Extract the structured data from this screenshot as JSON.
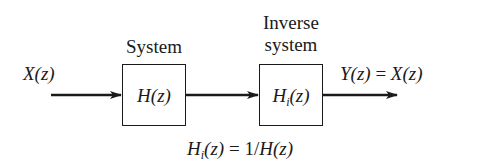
{
  "diagram": {
    "type": "block-diagram",
    "input": {
      "label_main": "X",
      "label_arg": "(z)"
    },
    "blocks": [
      {
        "title": "System",
        "fn_main": "H",
        "fn_sub": "",
        "fn_arg": "(z)"
      },
      {
        "title_line1": "Inverse",
        "title_line2": "system",
        "fn_main": "H",
        "fn_sub": "i",
        "fn_arg": "(z)"
      }
    ],
    "output": {
      "label_main": "Y",
      "label_arg": "(z)",
      "equals": " = ",
      "rhs_main": "X",
      "rhs_arg": "(z)"
    },
    "relation": {
      "lhs_main": "H",
      "lhs_sub": "i",
      "lhs_arg": "(z)",
      "equals": " = ",
      "rhs_num": "1/",
      "rhs_main": "H",
      "rhs_arg": "(z)"
    },
    "colors": {
      "stroke": "#1a1a1a",
      "background": "#ffffff"
    }
  }
}
